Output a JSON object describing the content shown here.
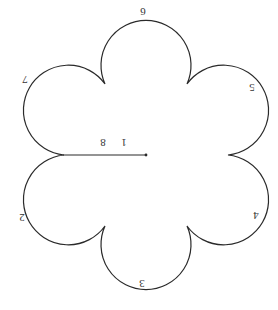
{
  "figure": {
    "stroke_color": "#2a2a2a",
    "background": "#ffffff",
    "center": [
      146,
      155
    ],
    "cusp_radius": 82,
    "lobe_center_distance": 91,
    "lobe_radius": 45,
    "lobe_count": 6,
    "rotation_deg": 180
  },
  "labels": {
    "radius_outer": "8",
    "radius_inner": "1",
    "lobe_top": "6",
    "lobe_upper_left": "7",
    "lobe_upper_right": "5",
    "lobe_lower_right": "4",
    "lobe_bottom": "3",
    "lobe_lower_left": "2"
  }
}
